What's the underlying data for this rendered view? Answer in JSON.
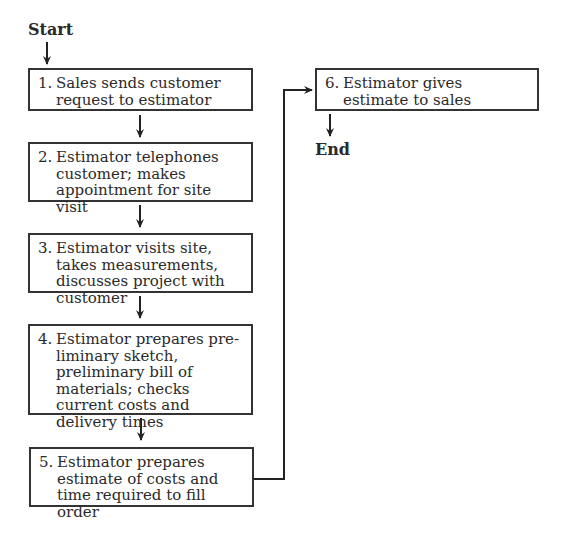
{
  "start_label": "Start",
  "end_label": "End",
  "steps": [
    {
      "num": "1.",
      "text": "Sales sends customer request to estimator"
    },
    {
      "num": "2.",
      "text": "Estimator telephones customer; makes appointment for site visit"
    },
    {
      "num": "3.",
      "text": "Estimator visits site, takes measurements, discusses project with customer"
    },
    {
      "num": "4.",
      "text": "Estimator prepares pre-liminary sketch, preliminary bill of materials; checks current costs and delivery times"
    },
    {
      "num": "5.",
      "text": "Estimator prepares estimate of costs and time required to fill order"
    },
    {
      "num": "6.",
      "text": "Estimator gives estimate to sales"
    }
  ]
}
